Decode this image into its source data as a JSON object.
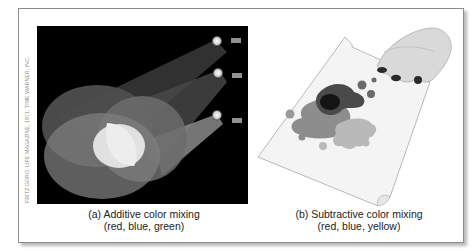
{
  "figure": {
    "credit": "FRITZ GORO, LIFE MAGAZINE, 1971, TIME WARNER, INC.",
    "panels": [
      {
        "id": "a",
        "caption_line1": "(a) Additive color mixing",
        "caption_line2": "(red, blue, green)",
        "image": "three-spotlights-overlapping-circles"
      },
      {
        "id": "b",
        "caption_line1": "(b) Subtractive color mixing",
        "caption_line2": "(red, blue, yellow)",
        "image": "hand-paint-splats-on-paper"
      }
    ]
  }
}
